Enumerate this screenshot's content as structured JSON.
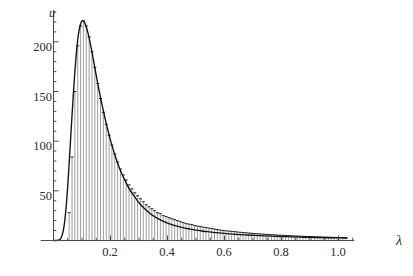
{
  "chart_data": {
    "type": "area",
    "title": "",
    "subtitle": "",
    "xlabel": "λ",
    "ylabel": "u",
    "xlim": [
      0,
      1.05
    ],
    "ylim": [
      0,
      232
    ],
    "grid": false,
    "legend": "none",
    "axis_style": "two-axis-lines-with-minor-ticks",
    "x_tick_labels": [
      "0.2",
      "0.4",
      "0.6",
      "0.8",
      "1.0"
    ],
    "x_tick_values": [
      0.2,
      0.4,
      0.6,
      0.8,
      1.0
    ],
    "x_minor_tick_step": 0.05,
    "y_tick_labels": [
      "50",
      "100",
      "150",
      "200"
    ],
    "y_tick_values": [
      50,
      100,
      150,
      200
    ],
    "y_minor_tick_step": 10,
    "peak": {
      "x": 0.123,
      "y": 220
    },
    "series": [
      {
        "name": "histogram",
        "type": "bar",
        "color": "#8c8c8c",
        "cap_color": "#1a1a1a",
        "bar_width": 0.0035,
        "x": [
          0.055,
          0.065,
          0.075,
          0.085,
          0.095,
          0.105,
          0.115,
          0.125,
          0.135,
          0.145,
          0.155,
          0.165,
          0.175,
          0.185,
          0.195,
          0.205,
          0.215,
          0.225,
          0.235,
          0.245,
          0.255,
          0.265,
          0.275,
          0.285,
          0.295,
          0.305,
          0.315,
          0.325,
          0.335,
          0.345,
          0.355,
          0.365,
          0.375,
          0.385,
          0.395,
          0.405,
          0.415,
          0.425,
          0.435,
          0.445,
          0.455,
          0.465,
          0.475,
          0.485,
          0.495,
          0.505,
          0.515,
          0.525,
          0.535,
          0.545,
          0.555,
          0.565,
          0.575,
          0.585,
          0.595,
          0.605,
          0.615,
          0.625,
          0.635,
          0.645,
          0.655,
          0.665,
          0.675,
          0.685,
          0.695,
          0.705,
          0.715,
          0.725,
          0.735,
          0.745,
          0.755,
          0.765,
          0.775,
          0.785,
          0.795,
          0.805,
          0.815,
          0.825,
          0.835,
          0.845,
          0.855,
          0.865,
          0.875,
          0.885,
          0.895,
          0.905,
          0.915,
          0.925,
          0.935,
          0.945,
          0.955,
          0.965,
          0.975,
          0.985,
          0.995,
          1.005,
          1.015,
          1.025
        ],
        "values": [
          28,
          84,
          150,
          196,
          216,
          221,
          216,
          205,
          190,
          174,
          158,
          143,
          129,
          117,
          106,
          96,
          87,
          79,
          72,
          66,
          61,
          56,
          52,
          48,
          45,
          42,
          39,
          36,
          34,
          32,
          30,
          28,
          27,
          25,
          24,
          23,
          22,
          21,
          20,
          19,
          18,
          17,
          16.5,
          16,
          15,
          14.5,
          14,
          13.5,
          13,
          12.5,
          12,
          11.5,
          11,
          10.5,
          10,
          9.8,
          9.5,
          9.2,
          8.9,
          8.6,
          8.3,
          8,
          7.8,
          7.5,
          7.3,
          7,
          6.8,
          6.6,
          6.4,
          6.2,
          6,
          5.8,
          5.7,
          5.5,
          5.3,
          5.2,
          5,
          4.9,
          4.7,
          4.6,
          4.5,
          4.3,
          4.2,
          4.1,
          4,
          3.9,
          3.8,
          3.7,
          3.6,
          3.5,
          3.4,
          3.3,
          3.2,
          3.1,
          3,
          3,
          2.9,
          2.9
        ]
      },
      {
        "name": "fitted-curve",
        "type": "line",
        "color": "#111111",
        "x": [
          0.0,
          0.01,
          0.02,
          0.025,
          0.03,
          0.035,
          0.04,
          0.045,
          0.05,
          0.055,
          0.06,
          0.065,
          0.07,
          0.075,
          0.08,
          0.085,
          0.09,
          0.095,
          0.1,
          0.105,
          0.11,
          0.115,
          0.12,
          0.125,
          0.13,
          0.135,
          0.14,
          0.145,
          0.15,
          0.16,
          0.17,
          0.18,
          0.19,
          0.2,
          0.21,
          0.22,
          0.23,
          0.24,
          0.25,
          0.26,
          0.27,
          0.28,
          0.29,
          0.3,
          0.32,
          0.34,
          0.36,
          0.38,
          0.4,
          0.42,
          0.44,
          0.46,
          0.48,
          0.5,
          0.52,
          0.54,
          0.56,
          0.58,
          0.6,
          0.64,
          0.68,
          0.72,
          0.76,
          0.8,
          0.84,
          0.88,
          0.92,
          0.96,
          1.0,
          1.03
        ],
        "values": [
          0,
          0,
          0.6,
          2,
          5,
          11,
          21,
          36,
          55,
          78,
          102,
          126,
          149,
          170,
          188,
          202,
          212,
          218,
          221,
          221,
          219,
          215,
          210,
          204,
          197,
          190,
          182,
          174,
          166,
          151,
          137,
          124,
          112,
          101,
          91,
          82,
          74,
          67,
          61,
          55,
          50,
          46,
          42,
          38,
          32,
          27,
          23,
          20,
          17.5,
          15.5,
          14,
          12.5,
          11.5,
          10.5,
          9.6,
          8.9,
          8.2,
          7.6,
          7.1,
          6.2,
          5.5,
          4.9,
          4.4,
          4.0,
          3.6,
          3.3,
          3.0,
          2.8,
          2.6,
          2.5
        ]
      }
    ]
  },
  "figure": {
    "background": "#ffffff",
    "axis_color": "#4a4a4a",
    "text_color": "#2b2b2b"
  }
}
